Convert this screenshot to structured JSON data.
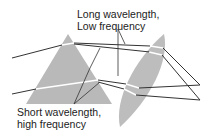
{
  "diagram": {
    "labels": {
      "long_line1": "Long wavelength,",
      "long_line2": "Low frequency",
      "short_line1": "Short wavelength,",
      "short_line2": "high frequency"
    },
    "elements": {
      "prism": "prism",
      "lens": "lens",
      "rays": [
        "upper incident ray",
        "lower incident ray"
      ]
    },
    "colors": {
      "glass": "#b9b9b9",
      "ray": "#333333",
      "ray_inside": "#ffffff",
      "text": "#222222"
    }
  }
}
